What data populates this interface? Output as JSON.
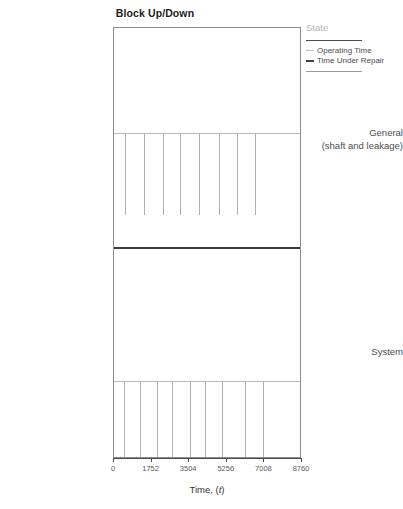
{
  "chart_data": {
    "type": "table",
    "title": "Block Up/Down",
    "xlabel": "Time, (t)",
    "ylabel": "",
    "xlim": [
      0,
      8760
    ],
    "xticks": [
      0,
      1752,
      3504,
      5256,
      7008,
      8760
    ],
    "xticklabels": [
      "0",
      "1752",
      "3504",
      "5256",
      "7008",
      "8760"
    ],
    "grid": false,
    "legend_position": "right",
    "legend_title": "State",
    "series": [
      {
        "name": "Operating Time",
        "style": "thin-light-line",
        "color": "#bdbdbd"
      },
      {
        "name": "Time Under Repair",
        "style": "thick-dark-line",
        "color": "#3f3f3f"
      }
    ],
    "categories": [
      "General (shaft and leakage)",
      "System"
    ],
    "rows": [
      {
        "label_line1": "General",
        "label_line2": "(shaft and leakage)",
        "repair_events_t": [
          530,
          1430,
          2290,
          3120,
          4020,
          4930,
          5800,
          6640
        ]
      },
      {
        "label_line1": "System",
        "label_line2": "",
        "repair_events_t": [
          450,
          1230,
          2010,
          2750,
          3560,
          4290,
          5070,
          6190,
          7000
        ]
      }
    ]
  },
  "title": "Block Up/Down",
  "axis": {
    "x_title_prefix": "Time, (",
    "x_title_var": "t",
    "x_title_suffix": ")",
    "tick_labels": [
      "0",
      "1752",
      "3504",
      "5256",
      "7008",
      "8760"
    ]
  },
  "ylabels": {
    "general_line1": "General",
    "general_line2": "(shaft and leakage)",
    "system": "System"
  },
  "legend": {
    "title": "State",
    "items": [
      {
        "label": "Operating Time"
      },
      {
        "label": "Time Under Repair"
      }
    ]
  }
}
